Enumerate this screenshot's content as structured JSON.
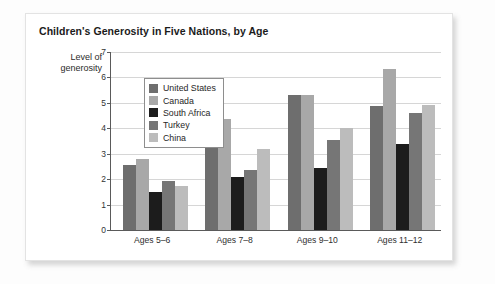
{
  "card": {
    "title": "Children's Generosity in Five Nations, by Age"
  },
  "chart_data": {
    "type": "bar",
    "title": "Children's Generosity in Five Nations, by Age",
    "xlabel": "",
    "ylabel": "Level of generosity",
    "ylabel_lines": [
      "Level of",
      "generosity"
    ],
    "ylim": [
      0,
      7
    ],
    "yticks": [
      0,
      1,
      2,
      3,
      4,
      5,
      6,
      7
    ],
    "ytick_labels": [
      "0",
      "1",
      "2",
      "3",
      "4",
      "5",
      "6",
      "7"
    ],
    "grid": true,
    "legend_position": "top-left-inside",
    "categories": [
      "Ages 5–6",
      "Ages 7–8",
      "Ages 9–10",
      "Ages 11–12"
    ],
    "series": [
      {
        "name": "United States",
        "color": "#6e6e6e",
        "values": [
          2.55,
          3.22,
          5.3,
          4.88
        ]
      },
      {
        "name": "Canada",
        "color": "#a8a8a8",
        "values": [
          2.78,
          4.35,
          5.3,
          6.35
        ]
      },
      {
        "name": "South Africa",
        "color": "#1c1c1c",
        "values": [
          1.5,
          2.1,
          2.45,
          3.4
        ]
      },
      {
        "name": "Turkey",
        "color": "#767676",
        "values": [
          1.93,
          2.37,
          3.55,
          4.6
        ]
      },
      {
        "name": "China",
        "color": "#bcbcbc",
        "values": [
          1.75,
          3.2,
          4.0,
          4.9
        ]
      }
    ]
  }
}
